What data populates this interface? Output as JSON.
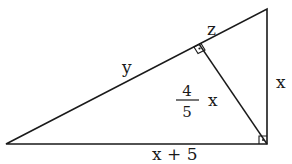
{
  "diagram": {
    "type": "right-triangle-with-altitude",
    "vertices": {
      "left": {
        "x": 6,
        "y": 144
      },
      "top_right": {
        "x": 267,
        "y": 9
      },
      "bottom_right": {
        "x": 267,
        "y": 144
      },
      "altitude_foot": {
        "x": 200,
        "y": 44
      }
    },
    "labels": {
      "hypotenuse_long_segment": "y",
      "hypotenuse_short_segment": "z",
      "vertical_leg": "x",
      "base": "x + 5",
      "altitude_numerator": "4",
      "altitude_denominator": "5",
      "altitude_variable": "x"
    },
    "colors": {
      "stroke": "#1a1a1a",
      "background": "#ffffff"
    }
  }
}
